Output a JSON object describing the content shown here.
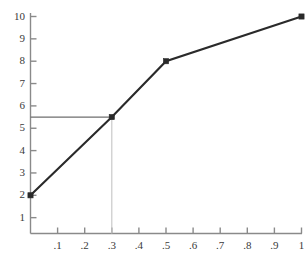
{
  "chart_data": {
    "type": "line",
    "title": "",
    "subtitle": "",
    "xlabel": "",
    "ylabel": "",
    "xlim": [
      0,
      1
    ],
    "ylim": [
      0,
      10
    ],
    "grid": false,
    "legend": null,
    "x": [
      0,
      0.3,
      0.5,
      1
    ],
    "values": [
      2,
      5.5,
      8,
      10
    ],
    "series": [
      {
        "name": "curve",
        "x": [
          0,
          0.3,
          0.5,
          1
        ],
        "values": [
          2,
          5.5,
          8,
          10
        ],
        "marker": "filled-square",
        "color": "#2a2a2a"
      }
    ],
    "xticks": [
      0.1,
      0.2,
      0.3,
      0.4,
      0.5,
      0.6,
      0.7,
      0.8,
      0.9,
      1
    ],
    "xticklabels": [
      ".1",
      ".2",
      ".3",
      ".4",
      ".5",
      ".6",
      ".7",
      ".8",
      ".9",
      "1"
    ],
    "yticks": [
      1,
      2,
      3,
      4,
      5,
      6,
      7,
      8,
      9,
      10
    ],
    "yticklabels": [
      "1",
      "2",
      "3",
      "4",
      "5",
      "6",
      "7",
      "8",
      "9",
      "10"
    ],
    "annotations": [
      {
        "name": "horizontal-reference-line",
        "type": "hline",
        "y": 5.5,
        "x_from": 0,
        "x_to": 0.3,
        "color": "#6e6e6e"
      },
      {
        "name": "vertical-dropline",
        "type": "vline",
        "x": 0.3,
        "y_from": 0,
        "y_to": 5.5,
        "color": "#c4c4c4"
      }
    ]
  },
  "colors": {
    "background": "#ffffff",
    "data_line": "#2a2a2a",
    "axis": "#8a8a8a",
    "tick_label": "#3a3a3a",
    "reference_line": "#6e6e6e",
    "dropline": "#c4c4c4"
  }
}
